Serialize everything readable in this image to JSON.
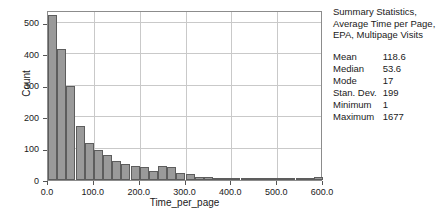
{
  "summary": {
    "title_lines": [
      "Summary Statistics,",
      "Average Time per Page,",
      "EPA, Multipage Visits"
    ],
    "stats": [
      {
        "name": "Mean",
        "value": "118.6"
      },
      {
        "name": "Median",
        "value": "53.6"
      },
      {
        "name": "Mode",
        "value": "17"
      },
      {
        "name": "Stan. Dev.",
        "value": "199"
      },
      {
        "name": "Minimum",
        "value": "1"
      },
      {
        "name": "Maximum",
        "value": "1677"
      }
    ]
  },
  "chart_data": {
    "type": "bar",
    "subtype": "histogram",
    "title": "",
    "xlabel": "Time_per_page",
    "ylabel": "Count",
    "xlim": [
      0,
      600
    ],
    "ylim": [
      0,
      540
    ],
    "xticks": [
      "0.0",
      "100.0",
      "200.0",
      "300.0",
      "400.0",
      "500.0",
      "600.0"
    ],
    "xtick_values": [
      0,
      100,
      200,
      300,
      400,
      500,
      600
    ],
    "yticks": [
      "0",
      "100",
      "200",
      "300",
      "400",
      "500"
    ],
    "ytick_values": [
      0,
      100,
      200,
      300,
      400,
      500
    ],
    "grid": true,
    "legend": "none",
    "bin_width": 20,
    "bin_starts": [
      0,
      20,
      40,
      60,
      80,
      100,
      120,
      140,
      160,
      180,
      200,
      220,
      240,
      260,
      280,
      300,
      320,
      340,
      360,
      380,
      400,
      420,
      440,
      460,
      480,
      500,
      520,
      540,
      560,
      580
    ],
    "values": [
      525,
      415,
      298,
      170,
      118,
      96,
      78,
      60,
      50,
      44,
      40,
      30,
      44,
      42,
      22,
      18,
      10,
      9,
      6,
      5,
      4,
      4,
      3,
      3,
      3,
      3,
      6,
      4,
      4,
      9
    ],
    "bar_color": "#9a9a9a",
    "bar_edge_color": "#5d5d5d",
    "grid_color": "#c9c9c9",
    "axis_color": "#8c8c8c"
  }
}
